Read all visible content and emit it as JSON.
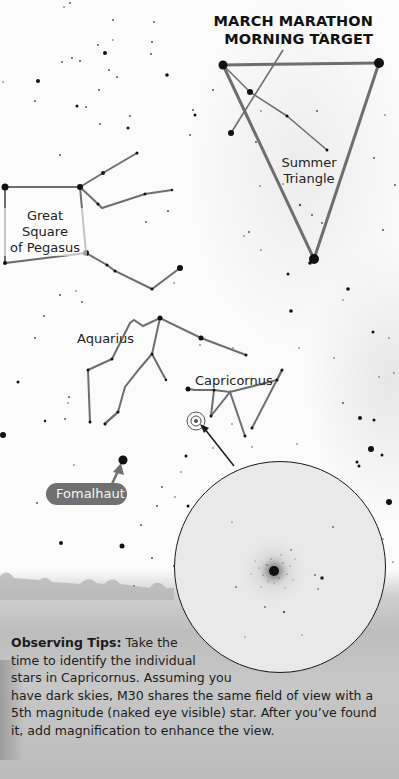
{
  "title": {
    "line1": "MARCH MARATHON",
    "line2": "MORNING TARGET"
  },
  "labels": {
    "summer_triangle_1": "Summer",
    "summer_triangle_2": "Triangle",
    "pegasus_1": "Great Square",
    "pegasus_2": "of Pegasus",
    "aquarius": "Aquarius",
    "capricornus": "Capricornus",
    "fomalhaut": "Fomalhaut"
  },
  "inset": {
    "target": "M30",
    "description": "Eyepiece view of globular cluster M30"
  },
  "tips": {
    "heading": "Observing Tips:",
    "lines": [
      " Take the",
      "time to identify the individual",
      "stars in Capricornus. Assuming you",
      "have dark skies, M30 shares the same field of view with a",
      "5th magnitude (naked eye visible) star. After you’ve found",
      "it, add magnification to enhance the view."
    ]
  },
  "colors": {
    "line": "#6e6e6e",
    "star": "#111111",
    "pill": "#707070",
    "text": "#1c1c1c"
  }
}
